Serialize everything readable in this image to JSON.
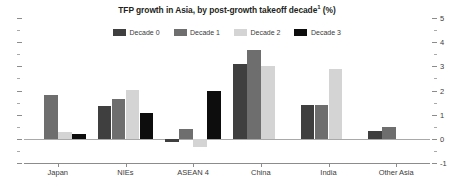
{
  "chart_data": {
    "type": "bar",
    "title_main": "TFP growth in Asia, by post-growth takeoff decade",
    "title_sup": "1",
    "title_tail": " (%)",
    "xlabel": "",
    "ylabel": "",
    "ylim": [
      -1,
      5
    ],
    "ytick_labels": [
      "5",
      "4",
      "3",
      "2",
      "1",
      "0",
      "-1"
    ],
    "ytick_values": [
      5,
      4,
      3,
      2,
      1,
      0,
      -1
    ],
    "yminor_values": [
      4.5,
      3.5,
      2.5,
      1.5,
      0.5,
      -0.5
    ],
    "grid": false,
    "axis_position": "right",
    "legend_position": "top-center",
    "categories": [
      "Japan",
      "NIEs",
      "ASEAN 4",
      "China",
      "India",
      "Other Asia"
    ],
    "series": [
      {
        "name": "Decade 0",
        "color": "#3f3f3f",
        "values": [
          null,
          1.35,
          -0.12,
          3.1,
          1.4,
          0.32
        ]
      },
      {
        "name": "Decade 1",
        "color": "#6e6e6e",
        "values": [
          1.8,
          1.65,
          0.42,
          3.68,
          1.4,
          0.48
        ]
      },
      {
        "name": "Decade 2",
        "color": "#d4d4d4",
        "values": [
          0.3,
          2.02,
          -0.35,
          3.0,
          2.9,
          null
        ]
      },
      {
        "name": "Decade 3",
        "color": "#0d0d0d",
        "values": [
          0.22,
          1.08,
          1.98,
          null,
          null,
          null
        ]
      }
    ]
  }
}
